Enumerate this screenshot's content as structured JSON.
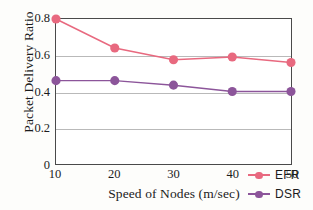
{
  "chart_data": {
    "type": "line",
    "title": "",
    "xlabel": "Speed of Nodes (m/sec)",
    "ylabel": "Packet Delivery Ratio",
    "x": [
      10,
      20,
      30,
      40,
      50
    ],
    "xtick_labels": [
      "10",
      "20",
      "30",
      "40",
      "50"
    ],
    "ytick_labels": [
      "0",
      "0.2",
      "0.4",
      "0.6",
      "0.8"
    ],
    "ytick_values": [
      0,
      0.2,
      0.4,
      0.6,
      0.8
    ],
    "xlim": [
      10,
      50
    ],
    "ylim": [
      0,
      0.8
    ],
    "grid": "horizontal",
    "gridlines_at": [
      0.2,
      0.4,
      0.6
    ],
    "legend_position": "lower-right",
    "series": [
      {
        "name": "EFR",
        "color": "#e8697f",
        "marker": "circle",
        "values": [
          0.8,
          0.64,
          0.575,
          0.59,
          0.56
        ]
      },
      {
        "name": "DSR",
        "color": "#8c559a",
        "marker": "circle",
        "values": [
          0.46,
          0.46,
          0.435,
          0.4,
          0.4
        ]
      }
    ]
  },
  "colors": {
    "efr": "#e8697f",
    "dsr": "#8c559a",
    "axis": "#4a4a4a",
    "grid": "#b9b9b9",
    "text": "#1b1b1b",
    "background": "#fdfdfb",
    "plot_background": "#ffffff"
  },
  "axes": {
    "y_title": "Packet Delivery Ratio",
    "x_title": "Speed of Nodes (m/sec)",
    "y_ticks": [
      "0.8",
      "0.6",
      "0.4",
      "0.2",
      "0"
    ],
    "x_ticks": [
      "10",
      "20",
      "30",
      "40",
      "50"
    ]
  },
  "legend": {
    "items": [
      {
        "label": "EFR"
      },
      {
        "label": "DSR"
      }
    ]
  }
}
